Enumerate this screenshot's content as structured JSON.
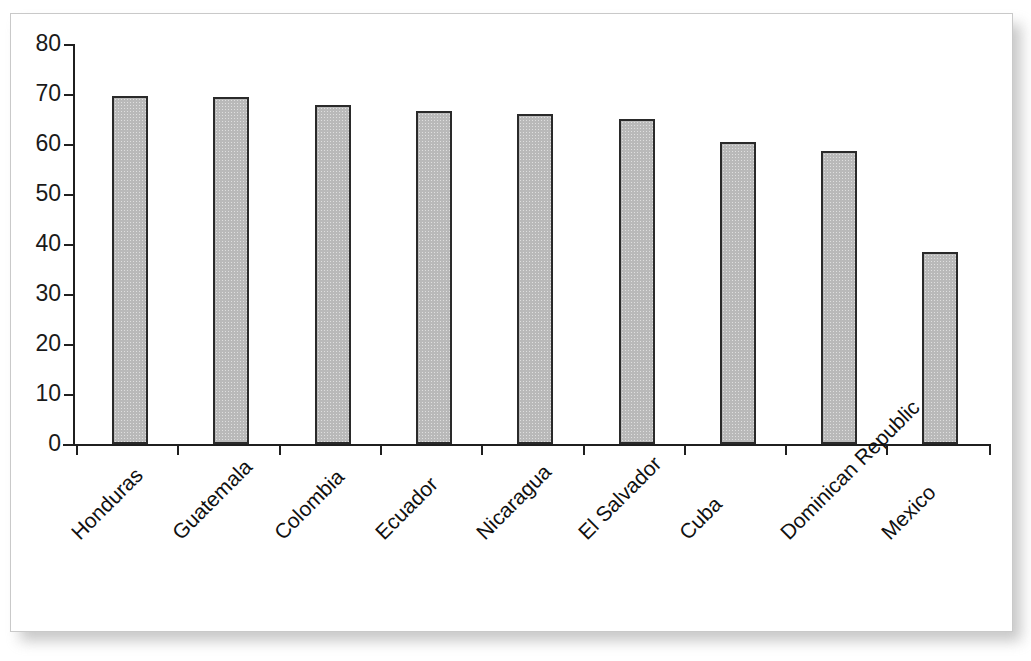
{
  "chart_data": {
    "type": "bar",
    "title": "",
    "subtitle": "",
    "xlabel": "",
    "ylabel": "",
    "ylim": [
      0,
      80
    ],
    "y_ticks": [
      0,
      10,
      20,
      30,
      40,
      50,
      60,
      70,
      80
    ],
    "grid": false,
    "legend": false,
    "legend_position": "none",
    "orientation": "vertical",
    "categories": [
      "Honduras",
      "Guatemala",
      "Colombia",
      "Ecuador",
      "Nicaragua",
      "El Salvador",
      "Cuba",
      "Dominican Republic",
      "Mexico"
    ],
    "values": [
      69.6,
      69.4,
      67.8,
      66.6,
      66.0,
      65.0,
      60.4,
      58.6,
      38.4
    ],
    "bar_color": "#b9b9b9",
    "bar_border_color": "#2a2a2a",
    "axis_color": "#1f1f1f",
    "tick_label_color": "#1a1a1a",
    "category_label_rotation_deg": -45
  }
}
